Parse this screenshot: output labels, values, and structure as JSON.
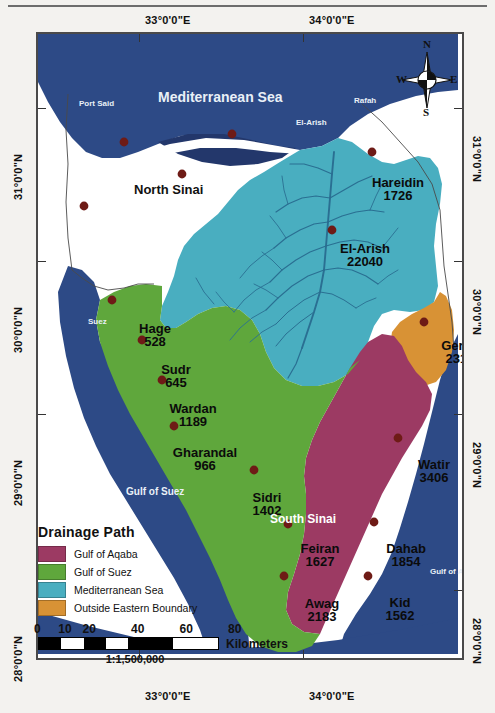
{
  "map": {
    "title_regions": {
      "north_sinai": "North Sinai",
      "south_sinai": "South Sinai"
    },
    "water_labels": [
      {
        "name": "Mediterranean Sea",
        "x": 120,
        "y": 55,
        "size": 14
      },
      {
        "name": "Gulf of Suez",
        "x": 88,
        "y": 452,
        "size": 10
      },
      {
        "name": "Gulf of Aqaba",
        "x": 392,
        "y": 533,
        "size": 8
      }
    ],
    "city_labels": [
      {
        "name": "Port Said",
        "x": 41,
        "y": 65
      },
      {
        "name": "Rafah",
        "x": 316,
        "y": 62
      },
      {
        "name": "El-Arish",
        "x": 258,
        "y": 84
      },
      {
        "name": "Suez",
        "x": 50,
        "y": 283
      },
      {
        "name": "Ras Mohammed",
        "x": 282,
        "y": 644
      }
    ],
    "basins": [
      {
        "name": "Hareidin",
        "value": "1726",
        "x": 360,
        "y": 142,
        "size": 13
      },
      {
        "name": "El-Arish",
        "value": "22040",
        "x": 327,
        "y": 208,
        "size": 13
      },
      {
        "name": "Gerafi",
        "value": "2318",
        "x": 422,
        "y": 305,
        "size": 13
      },
      {
        "name": "Hage",
        "value": "528",
        "x": 117,
        "y": 288,
        "size": 13
      },
      {
        "name": "Sudr",
        "value": "645",
        "x": 138,
        "y": 329,
        "size": 13
      },
      {
        "name": "Wardan",
        "value": "1189",
        "x": 155,
        "y": 368,
        "size": 13
      },
      {
        "name": "Gharandal",
        "value": "966",
        "x": 167,
        "y": 412,
        "size": 13
      },
      {
        "name": "Watir",
        "value": "3406",
        "x": 396,
        "y": 424,
        "size": 13
      },
      {
        "name": "Sidri",
        "value": "1402",
        "x": 229,
        "y": 457,
        "size": 13
      },
      {
        "name": "Dahab",
        "value": "1854",
        "x": 368,
        "y": 508,
        "size": 13
      },
      {
        "name": "Feiran",
        "value": "1627",
        "x": 282,
        "y": 508,
        "size": 13
      },
      {
        "name": "Kid",
        "value": "1562",
        "x": 362,
        "y": 562,
        "size": 13
      },
      {
        "name": "Awag",
        "value": "2183",
        "x": 284,
        "y": 563,
        "size": 13
      }
    ],
    "longitude_labels": [
      {
        "label": "33°0'0\"E",
        "x": 137
      },
      {
        "label": "34°0'0\"E",
        "x": 301
      }
    ],
    "latitude_labels": [
      {
        "label": "31°0'0\"N",
        "y": 138
      },
      {
        "label": "30°0'0\"N",
        "y": 291
      },
      {
        "label": "29°0'0\"N",
        "y": 444
      },
      {
        "label": "28°0'0\"N",
        "y": 620
      }
    ],
    "colors": {
      "gulf_of_aqaba": "#9c3a63",
      "gulf_of_suez": "#5fa73c",
      "mediterranean_basin": "#49aec0",
      "outside_eastern_boundary": "#d89235",
      "sea": "#2d4a86",
      "sea_dark": "#23376b",
      "land": "#ffffff",
      "point_marker": "#6e1b16",
      "frame": "#4a4a4a"
    }
  },
  "compass": {
    "north": "N",
    "east": "E",
    "south": "S",
    "west": "W"
  },
  "legend": {
    "title": "Drainage Path",
    "items": [
      {
        "label": "Gulf of Aqaba",
        "color": "#9c3a63"
      },
      {
        "label": "Gulf of Suez",
        "color": "#5fa73c"
      },
      {
        "label": "Mediterranean Sea",
        "color": "#49aec0"
      },
      {
        "label": "Outside Eastern Boundary",
        "color": "#d89235"
      }
    ]
  },
  "scale_bar": {
    "ticks": [
      "0",
      "10",
      "20",
      "40",
      "60",
      "80"
    ],
    "units": "Kilometers",
    "ratio": "1:1,500,000"
  }
}
